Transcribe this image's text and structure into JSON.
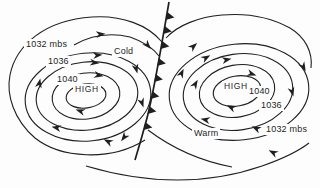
{
  "colors": {
    "background": "#fdfdfd",
    "ink": "#1f1f1f"
  },
  "left_system": {
    "isobar_outer_label": "1032 mbs",
    "isobar_middle_label": "1036",
    "isobar_inner_label": "1040",
    "center_label": "HIGH",
    "air_mass_label": "Cold"
  },
  "right_system": {
    "center_label": "HIGH",
    "isobar_inner_label": "1040",
    "isobar_middle_label": "1036",
    "isobar_outer_label": "1032 mbs",
    "air_mass_label": "Warm"
  }
}
